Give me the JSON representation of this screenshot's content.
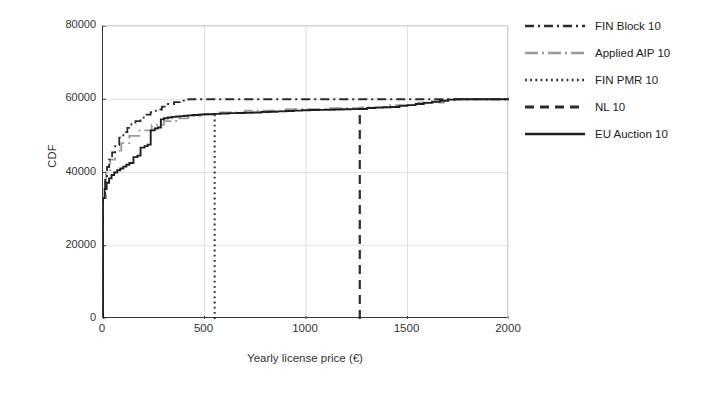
{
  "chart_data": {
    "type": "line",
    "title": "",
    "xlabel": "Yearly license price (€)",
    "ylabel": "CDF",
    "xlim": [
      0,
      2000
    ],
    "ylim": [
      0,
      80000
    ],
    "xticks": [
      0,
      500,
      1000,
      1500,
      2000
    ],
    "yticks": [
      0,
      20000,
      40000,
      60000,
      80000
    ],
    "grid": true,
    "legend_position": "right",
    "series": [
      {
        "name": "FIN Block 10",
        "style": "dash-dot",
        "color": "#2b2b2b",
        "x": [
          0,
          0,
          10,
          20,
          30,
          45,
          60,
          80,
          100,
          120,
          140,
          160,
          185,
          210,
          235,
          260,
          290,
          320,
          350,
          380,
          410,
          420,
          2000
        ],
        "y": [
          0,
          33000,
          39000,
          41500,
          43500,
          45500,
          47500,
          49500,
          51000,
          52200,
          53200,
          54000,
          55000,
          55800,
          56500,
          57200,
          58000,
          58700,
          59200,
          59600,
          59900,
          60000,
          60000
        ]
      },
      {
        "name": "Applied AIP 10",
        "style": "long-dash-dot",
        "color": "#9a9a9a",
        "x": [
          0,
          0,
          15,
          35,
          60,
          90,
          130,
          180,
          240,
          300,
          360,
          420,
          480,
          560,
          700,
          900,
          1100,
          1265,
          1400,
          1550,
          1680,
          1750,
          2000
        ],
        "y": [
          0,
          33000,
          40000,
          43500,
          46000,
          48000,
          50000,
          51500,
          53000,
          54000,
          54800,
          55400,
          55900,
          56400,
          56900,
          57300,
          57600,
          57800,
          58400,
          59100,
          59700,
          60000,
          60000
        ]
      },
      {
        "name": "FIN PMR 10",
        "style": "dotted",
        "color": "#2b2b2b",
        "vertical_at": 550,
        "x": [
          550,
          550
        ],
        "y": [
          0,
          56800
        ]
      },
      {
        "name": "NL 10",
        "style": "dashed",
        "color": "#2b2b2b",
        "vertical_at": 1265,
        "x": [
          1265,
          1265
        ],
        "y": [
          0,
          57300
        ]
      },
      {
        "name": "EU Auction 10",
        "style": "solid",
        "color": "#1f1f1f",
        "x": [
          0,
          0,
          8,
          18,
          30,
          42,
          55,
          70,
          85,
          100,
          115,
          130,
          150,
          150,
          170,
          185,
          185,
          205,
          220,
          235,
          235,
          255,
          270,
          285,
          285,
          300,
          320,
          340,
          360,
          380,
          400,
          420,
          440,
          470,
          500,
          540,
          580,
          620,
          660,
          700,
          740,
          780,
          820,
          860,
          900,
          940,
          980,
          1020,
          1060,
          1100,
          1140,
          1180,
          1220,
          1260,
          1300,
          1340,
          1380,
          1420,
          1460,
          1500,
          1540,
          1580,
          1620,
          1660,
          1700,
          1740,
          1800,
          1900,
          2000
        ],
        "y": [
          0,
          33000,
          35500,
          37200,
          38400,
          39300,
          40000,
          40600,
          41100,
          41600,
          42100,
          42600,
          43000,
          44200,
          44600,
          45000,
          46800,
          47200,
          47600,
          48000,
          51500,
          52000,
          52300,
          52600,
          54500,
          54800,
          55000,
          55200,
          55300,
          55400,
          55500,
          55600,
          55700,
          55800,
          55900,
          56000,
          56100,
          56200,
          56250,
          56300,
          56400,
          56500,
          56600,
          56700,
          56800,
          56900,
          57000,
          57050,
          57100,
          57150,
          57200,
          57250,
          57300,
          57350,
          57600,
          57700,
          57800,
          57900,
          58200,
          58400,
          58700,
          59000,
          59300,
          59600,
          59900,
          60000,
          60000,
          60000,
          60000
        ]
      }
    ]
  },
  "legend": {
    "items": [
      {
        "label": "FIN Block 10"
      },
      {
        "label": "Applied AIP 10"
      },
      {
        "label": "FIN PMR 10"
      },
      {
        "label": "NL 10"
      },
      {
        "label": "EU Auction 10"
      }
    ]
  },
  "axes": {
    "x_tick_labels": [
      "0",
      "500",
      "1000",
      "1500",
      "2000"
    ],
    "y_tick_labels": [
      "0",
      "20000",
      "40000",
      "60000",
      "80000"
    ]
  }
}
